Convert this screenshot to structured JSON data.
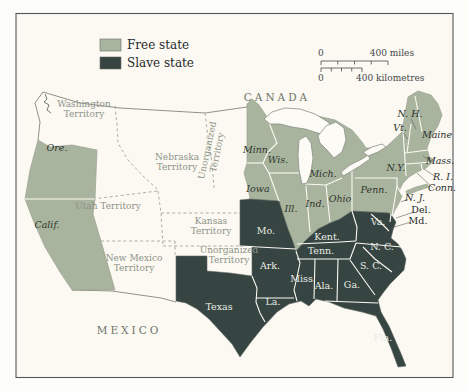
{
  "colors": {
    "free_state": "#a9b49e",
    "slave_state": "#364442",
    "map_background": "#fbf9f2",
    "frame": "#53565a",
    "national_border": "#82877e",
    "territory_dash": "#989d92",
    "lake_fill": "#fcfbf6",
    "lake_edge": "#8a9086",
    "free_edge": "#99a18f",
    "slave_edge": "#5f6a62"
  },
  "legend": {
    "items": [
      {
        "label": "Free state",
        "swatch": "free"
      },
      {
        "label": "Slave state",
        "swatch": "slave"
      }
    ]
  },
  "scale_bar": {
    "miles_start": "0",
    "miles_end": "400 miles",
    "km_start": "0",
    "km_end": "400 kilometres"
  },
  "map_labels": [
    {
      "id": "canada",
      "text": "CANADA",
      "x": 277,
      "y": 101,
      "cls": "c-country"
    },
    {
      "id": "mexico",
      "text": "MEXICO",
      "x": 129,
      "y": 334,
      "cls": "c-country"
    },
    {
      "id": "oregon",
      "text": "Ore.",
      "x": 57,
      "y": 151,
      "cls": "c-free",
      "size": 11
    },
    {
      "id": "california",
      "text": "Calif.",
      "x": 47,
      "y": 228,
      "cls": "c-free",
      "size": 10.5
    },
    {
      "id": "minnesota",
      "text": "Minn.",
      "x": 257,
      "y": 153,
      "cls": "c-free"
    },
    {
      "id": "wisconsin",
      "text": "Wis.",
      "x": 278,
      "y": 163,
      "cls": "c-free"
    },
    {
      "id": "michigan",
      "text": "Mich.",
      "x": 323,
      "y": 177,
      "cls": "c-free"
    },
    {
      "id": "iowa",
      "text": "Iowa",
      "x": 258,
      "y": 192,
      "cls": "c-free"
    },
    {
      "id": "illinois",
      "text": "Ill.",
      "x": 291,
      "y": 212,
      "cls": "c-free"
    },
    {
      "id": "indiana",
      "text": "Ind.",
      "x": 315,
      "y": 207,
      "cls": "c-free"
    },
    {
      "id": "ohio",
      "text": "Ohio",
      "x": 340,
      "y": 202,
      "cls": "c-free"
    },
    {
      "id": "pennsylvania",
      "text": "Penn.",
      "x": 374,
      "y": 193,
      "cls": "c-free"
    },
    {
      "id": "new-york",
      "text": "N.Y.",
      "x": 396,
      "y": 171,
      "cls": "c-free"
    },
    {
      "id": "new-jersey",
      "text": "N. J.",
      "x": 415,
      "y": 201,
      "cls": "c-east"
    },
    {
      "id": "maine",
      "text": "Maine",
      "x": 437,
      "y": 138,
      "cls": "c-east"
    },
    {
      "id": "new-hampshire",
      "text": "N. H.",
      "x": 410,
      "y": 117,
      "cls": "c-east"
    },
    {
      "id": "vermont",
      "text": "Vt.",
      "x": 400,
      "y": 131,
      "cls": "c-east"
    },
    {
      "id": "massachusetts",
      "text": "Mass.",
      "x": 440,
      "y": 164,
      "cls": "c-east"
    },
    {
      "id": "rhode-island",
      "text": "R. I.",
      "x": 443,
      "y": 180,
      "cls": "c-east"
    },
    {
      "id": "connecticut",
      "text": "Conn.",
      "x": 442,
      "y": 191,
      "cls": "c-east"
    },
    {
      "id": "delaware",
      "text": "Del.",
      "x": 421,
      "y": 213,
      "cls": "c-dm"
    },
    {
      "id": "maryland",
      "text": "Md.",
      "x": 418,
      "y": 224,
      "cls": "c-dm"
    },
    {
      "id": "missouri",
      "text": "Mo.",
      "x": 266,
      "y": 234,
      "cls": "c-slave"
    },
    {
      "id": "kentucky",
      "text": "Kent.",
      "x": 327,
      "y": 240,
      "cls": "c-slave"
    },
    {
      "id": "tennessee",
      "text": "Tenn.",
      "x": 321,
      "y": 254,
      "cls": "c-slave"
    },
    {
      "id": "virginia",
      "text": "Va.",
      "x": 378,
      "y": 225,
      "cls": "c-slave"
    },
    {
      "id": "north-carolina",
      "text": "N. C.",
      "x": 382,
      "y": 250,
      "cls": "c-slave"
    },
    {
      "id": "south-carolina",
      "text": "S. C.",
      "x": 371,
      "y": 269,
      "cls": "c-slave"
    },
    {
      "id": "georgia",
      "text": "Ga.",
      "x": 352,
      "y": 288,
      "cls": "c-slave"
    },
    {
      "id": "alabama",
      "text": "Ala.",
      "x": 324,
      "y": 289,
      "cls": "c-slave"
    },
    {
      "id": "mississippi",
      "text": "Miss.",
      "x": 303,
      "y": 282,
      "cls": "c-slave"
    },
    {
      "id": "arkansas",
      "text": "Ark.",
      "x": 270,
      "y": 269,
      "cls": "c-slave"
    },
    {
      "id": "louisiana",
      "text": "La.",
      "x": 273,
      "y": 305,
      "cls": "c-slave"
    },
    {
      "id": "texas",
      "text": "Texas",
      "x": 219,
      "y": 310,
      "cls": "c-slave",
      "size": 12
    },
    {
      "id": "florida",
      "text": "Fla.",
      "x": 383,
      "y": 341,
      "cls": "c-slave",
      "size": 9
    },
    {
      "id": "washington-territory",
      "lines": [
        "Washington",
        "Territory"
      ],
      "x": 84,
      "y": 112,
      "cls": "c-terr"
    },
    {
      "id": "nebraska-territory",
      "lines": [
        "Nebraska",
        "Territory"
      ],
      "x": 177,
      "y": 165,
      "cls": "c-terr"
    },
    {
      "id": "unorganized-territory-north",
      "lines": [
        "Unorganized",
        "Territory"
      ],
      "x": 215,
      "y": 152,
      "cls": "c-terr",
      "rot": -78
    },
    {
      "id": "utah-territory",
      "text": "Utah Territory",
      "x": 108,
      "y": 209,
      "cls": "c-terr"
    },
    {
      "id": "kansas-territory",
      "lines": [
        "Kansas",
        "Territory"
      ],
      "x": 211,
      "y": 229,
      "cls": "c-terr"
    },
    {
      "id": "new-mexico-territory",
      "lines": [
        "New Mexico",
        "Territory"
      ],
      "x": 134,
      "y": 266,
      "cls": "c-terr"
    },
    {
      "id": "unorganized-territory-south",
      "lines": [
        "Unorganized",
        "Territory"
      ],
      "x": 229,
      "y": 258,
      "cls": "c-terr"
    }
  ]
}
